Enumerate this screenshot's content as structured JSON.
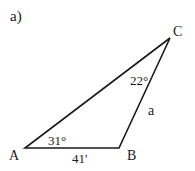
{
  "figure": {
    "part_label": "a)",
    "vertices": [
      {
        "name": "A",
        "label": "A"
      },
      {
        "name": "B",
        "label": "B"
      },
      {
        "name": "C",
        "label": "C"
      }
    ],
    "angles": {
      "A": "31°",
      "C": "22°"
    },
    "sides": {
      "AB": "41'",
      "BC": "a"
    },
    "stroke_color": "#1a1a1a"
  }
}
